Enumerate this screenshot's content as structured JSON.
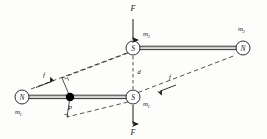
{
  "figure": {
    "background_color": "#fdfdfb",
    "line_color": "#1a1a1a",
    "point_color": "#000000"
  },
  "magnets": {
    "upper": {
      "south_pole_label": "S",
      "north_pole_label": "N",
      "pole_strength_label_left": "m",
      "pole_strength_sub_left": "2",
      "pole_strength_label_right": "m",
      "pole_strength_sub_right": "2"
    },
    "lower": {
      "north_pole_label": "N",
      "south_pole_label": "S",
      "pole_strength_label_left": "m",
      "pole_strength_sub_left": "1",
      "pole_strength_label_right": "m",
      "pole_strength_sub_right": "1"
    }
  },
  "forces": {
    "top_force_label": "F",
    "bottom_force_label": "F",
    "left_small_force_label": "f",
    "right_small_force_label": "f"
  },
  "distance": {
    "label": "d"
  },
  "point": {
    "label": "P"
  }
}
